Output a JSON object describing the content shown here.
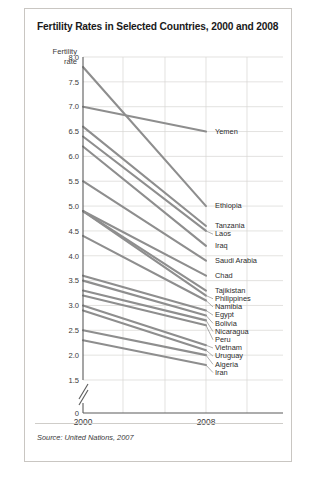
{
  "card": {
    "title": "Fertility Rates in Selected Countries, 2000 and 2008",
    "axis_name_line1": "Fertility",
    "axis_name_line2": "rate",
    "source": "Source: United Nations, 2007"
  },
  "colors": {
    "line": "#8e8e8e",
    "grid": "#d7d5d2",
    "axis": "#5b5b5b",
    "text": "#231f20",
    "card_border": "#c9c6c2",
    "background": "#ffffff"
  },
  "chart_data": {
    "type": "line",
    "title": "Fertility Rates in Selected Countries, 2000 and 2008",
    "xlabel": "",
    "ylabel": "Fertility rate",
    "x": [
      "2000",
      "2008"
    ],
    "categories": [
      "2000",
      "2008"
    ],
    "ylim": [
      1.5,
      8.0
    ],
    "yticks": [
      "8.0",
      "7.5",
      "7.0",
      "6.5",
      "6.0",
      "5.5",
      "5.0",
      "4.5",
      "4.0",
      "3.5",
      "3.0",
      "2.5",
      "2.0",
      "1.5",
      "0"
    ],
    "axis_break": true,
    "axis_break_note": "y-axis broken between 0 and 1.5",
    "grid": true,
    "legend": "right-side country labels",
    "series": [
      {
        "name": "Yemen",
        "values": [
          7.0,
          6.5
        ]
      },
      {
        "name": "Ethiopia",
        "values": [
          7.8,
          5.0
        ]
      },
      {
        "name": "Tanzania",
        "values": [
          6.6,
          4.6
        ]
      },
      {
        "name": "Laos",
        "values": [
          6.4,
          4.5
        ]
      },
      {
        "name": "Iraq",
        "values": [
          6.2,
          4.2
        ]
      },
      {
        "name": "Saudi Arabia",
        "values": [
          5.5,
          3.9
        ]
      },
      {
        "name": "Chad",
        "values": [
          4.9,
          3.6
        ]
      },
      {
        "name": "Tajikistan",
        "values": [
          4.9,
          3.3
        ]
      },
      {
        "name": "Philippines",
        "values": [
          4.9,
          3.2
        ]
      },
      {
        "name": "Namibia",
        "values": [
          4.4,
          3.1
        ]
      },
      {
        "name": "Egypt",
        "values": [
          3.6,
          2.9
        ]
      },
      {
        "name": "Bolivia",
        "values": [
          3.5,
          2.8
        ]
      },
      {
        "name": "Nicaragua",
        "values": [
          3.3,
          2.7
        ]
      },
      {
        "name": "Peru",
        "values": [
          3.2,
          2.6
        ]
      },
      {
        "name": "Vietnam",
        "values": [
          3.0,
          2.2
        ]
      },
      {
        "name": "Uruguay",
        "values": [
          2.9,
          2.1
        ]
      },
      {
        "name": "Algeria",
        "values": [
          2.5,
          2.0
        ]
      },
      {
        "name": "Iran",
        "values": [
          2.3,
          1.8
        ]
      }
    ],
    "labels_right": [
      {
        "text": "Yemen",
        "value": 6.5
      },
      {
        "text": "Ethiopia",
        "value": 5.0
      },
      {
        "text": "Tanzania",
        "value": 4.6
      },
      {
        "text": "Laos",
        "value": 4.5
      },
      {
        "text": "Iraq",
        "value": 4.2
      },
      {
        "text": "Saudi Arabia",
        "value": 3.9
      },
      {
        "text": "Chad",
        "value": 3.6
      },
      {
        "text": "Tajikistan",
        "value": 3.3
      },
      {
        "text": "Philippines",
        "value": 3.2
      },
      {
        "text": "Namibia",
        "value": 3.1
      },
      {
        "text": "Egypt",
        "value": 2.9
      },
      {
        "text": "Bolivia",
        "value": 2.8
      },
      {
        "text": "Nicaragua",
        "value": 2.7
      },
      {
        "text": "Peru",
        "value": 2.6
      },
      {
        "text": "Vietnam",
        "value": 2.2
      },
      {
        "text": "Uruguay",
        "value": 2.1
      },
      {
        "text": "Algeria",
        "value": 2.0
      },
      {
        "text": "Iran",
        "value": 1.8
      }
    ]
  }
}
